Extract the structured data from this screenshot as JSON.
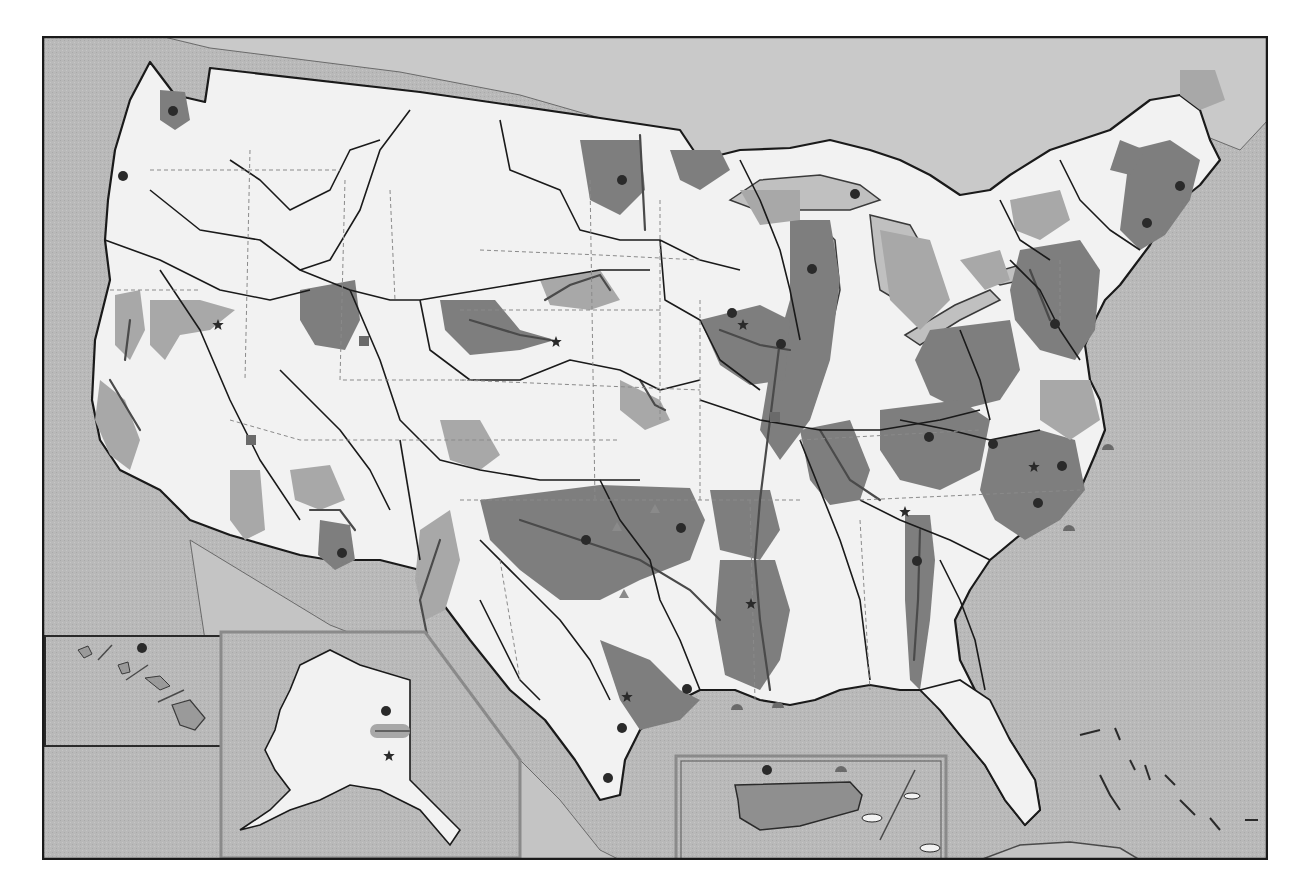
{
  "map": {
    "frame": {
      "x": 42,
      "y": 36,
      "w": 1226,
      "h": 824
    },
    "palette": {
      "water": "#b9b9b9",
      "land": "#f2f2f2",
      "shade_dark": "#7e7e7e",
      "shade_medium": "#a4a4a4",
      "shade_light": "#c6c6c6",
      "boundary": "#1a1a1a",
      "state_line": "#8a8a8a",
      "frame": "#1a1a1a",
      "symbol": "#2a2a2a"
    },
    "insets": [
      {
        "id": "hawaii",
        "x": 45,
        "y": 636,
        "w": 176,
        "h": 110
      },
      {
        "id": "alaska",
        "x": 221,
        "y": 632,
        "w": 300,
        "h": 226
      },
      {
        "id": "puerto-rico",
        "x": 676,
        "y": 756,
        "w": 270,
        "h": 104
      }
    ],
    "symbols": [
      {
        "type": "dot",
        "x": 173,
        "y": 111
      },
      {
        "type": "dot",
        "x": 123,
        "y": 176
      },
      {
        "type": "star",
        "x": 218,
        "y": 325
      },
      {
        "type": "square",
        "x": 364,
        "y": 341
      },
      {
        "type": "square",
        "x": 251,
        "y": 440
      },
      {
        "type": "dot",
        "x": 342,
        "y": 553
      },
      {
        "type": "star",
        "x": 556,
        "y": 342
      },
      {
        "type": "dot",
        "x": 622,
        "y": 180
      },
      {
        "type": "dot",
        "x": 855,
        "y": 194
      },
      {
        "type": "dot",
        "x": 812,
        "y": 269
      },
      {
        "type": "dot",
        "x": 732,
        "y": 313
      },
      {
        "type": "star",
        "x": 743,
        "y": 325
      },
      {
        "type": "dot",
        "x": 781,
        "y": 344
      },
      {
        "type": "square",
        "x": 775,
        "y": 417
      },
      {
        "type": "dot",
        "x": 1180,
        "y": 186
      },
      {
        "type": "dot",
        "x": 1147,
        "y": 223
      },
      {
        "type": "dot",
        "x": 1055,
        "y": 324
      },
      {
        "type": "dot",
        "x": 929,
        "y": 437
      },
      {
        "type": "dot",
        "x": 993,
        "y": 444
      },
      {
        "type": "star",
        "x": 1034,
        "y": 467
      },
      {
        "type": "dot",
        "x": 1062,
        "y": 466
      },
      {
        "type": "dot",
        "x": 1038,
        "y": 503
      },
      {
        "type": "star",
        "x": 905,
        "y": 512
      },
      {
        "type": "dot",
        "x": 681,
        "y": 528
      },
      {
        "type": "dot",
        "x": 586,
        "y": 540
      },
      {
        "type": "star",
        "x": 751,
        "y": 604
      },
      {
        "type": "dot",
        "x": 917,
        "y": 561
      },
      {
        "type": "dot",
        "x": 687,
        "y": 689
      },
      {
        "type": "star",
        "x": 627,
        "y": 697
      },
      {
        "type": "dot",
        "x": 622,
        "y": 728
      },
      {
        "type": "dot",
        "x": 608,
        "y": 778
      },
      {
        "type": "dot",
        "x": 386,
        "y": 711
      },
      {
        "type": "star",
        "x": 389,
        "y": 756
      },
      {
        "type": "dot",
        "x": 142,
        "y": 648
      },
      {
        "type": "dot",
        "x": 767,
        "y": 770
      },
      {
        "type": "semicircle",
        "x": 841,
        "y": 772
      },
      {
        "type": "semicircle",
        "x": 1108,
        "y": 450
      },
      {
        "type": "semicircle",
        "x": 1069,
        "y": 531
      },
      {
        "type": "semicircle",
        "x": 737,
        "y": 710
      },
      {
        "type": "semicircle",
        "x": 778,
        "y": 708
      },
      {
        "type": "triangle",
        "x": 624,
        "y": 594
      },
      {
        "type": "triangle",
        "x": 617,
        "y": 527
      },
      {
        "type": "triangle",
        "x": 655,
        "y": 509
      }
    ]
  }
}
